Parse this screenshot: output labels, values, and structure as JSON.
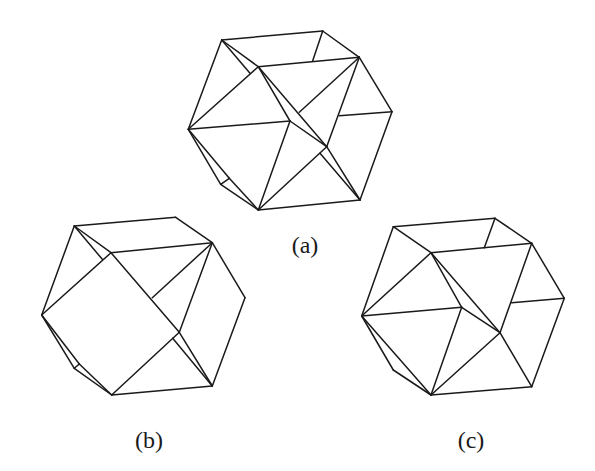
{
  "figure": {
    "panels": [
      {
        "id": "a",
        "label": "(a)",
        "label_pos": [
          305,
          253
        ],
        "edges": [
          [
            [
              221.7,
              40
            ],
            [
              322.7,
              31
            ]
          ],
          [
            [
              322.7,
              31
            ],
            [
              359.3,
              57.3
            ]
          ],
          [
            [
              322.7,
              31
            ],
            [
              312.7,
              60.7
            ]
          ],
          [
            [
              258.3,
              66.7
            ],
            [
              359.3,
              57.3
            ]
          ],
          [
            [
              221.7,
              40
            ],
            [
              258.3,
              66.7
            ]
          ],
          [
            [
              221.7,
              40
            ],
            [
              188.3,
              129.3
            ]
          ],
          [
            [
              221.7,
              40
            ],
            [
              250,
              73.3
            ]
          ],
          [
            [
              258.3,
              66.7
            ],
            [
              188.3,
              129.3
            ]
          ],
          [
            [
              359.3,
              57.3
            ],
            [
              392,
              111.7
            ]
          ],
          [
            [
              392,
              111.7
            ],
            [
              360,
              200
            ]
          ],
          [
            [
              392,
              111.7
            ],
            [
              339.3,
              115.7
            ]
          ],
          [
            [
              359.3,
              57.3
            ],
            [
              299.3,
              112.3
            ]
          ],
          [
            [
              359.3,
              57.3
            ],
            [
              326.7,
              146.7
            ]
          ],
          [
            [
              188.3,
              129.3
            ],
            [
              290,
              121
            ]
          ],
          [
            [
              258.3,
              66.7
            ],
            [
              290,
              121
            ]
          ],
          [
            [
              290,
              121
            ],
            [
              326.7,
              146.7
            ]
          ],
          [
            [
              258.3,
              66.7
            ],
            [
              326.7,
              146.7
            ]
          ],
          [
            [
              290,
              121
            ],
            [
              258.3,
              210
            ]
          ],
          [
            [
              326.7,
              146.7
            ],
            [
              258.3,
              210
            ]
          ],
          [
            [
              326.7,
              146.7
            ],
            [
              360,
              200
            ]
          ],
          [
            [
              320,
              153.3
            ],
            [
              360,
              200
            ]
          ],
          [
            [
              258.3,
              210
            ],
            [
              360,
              200
            ]
          ],
          [
            [
              188.3,
              129.3
            ],
            [
              220.7,
              184.3
            ]
          ],
          [
            [
              220.7,
              184.3
            ],
            [
              258.3,
              210
            ]
          ],
          [
            [
              188.3,
              129.3
            ],
            [
              229.3,
              178.3
            ]
          ],
          [
            [
              229.3,
              178.3
            ],
            [
              258.3,
              210
            ]
          ],
          [
            [
              220.7,
              184.3
            ],
            [
              229.3,
              178.3
            ]
          ]
        ]
      },
      {
        "id": "b",
        "label": "(b)",
        "label_pos": [
          149,
          448
        ],
        "edges": [
          [
            [
              74.3,
              226
            ],
            [
              175.7,
              217.3
            ]
          ],
          [
            [
              175.7,
              217.3
            ],
            [
              212.3,
              242.7
            ]
          ],
          [
            [
              111,
              252.7
            ],
            [
              212.3,
              242.7
            ]
          ],
          [
            [
              74.3,
              226
            ],
            [
              111,
              252.7
            ]
          ],
          [
            [
              74.3,
              226
            ],
            [
              41.7,
              315
            ]
          ],
          [
            [
              74.3,
              226
            ],
            [
              102.3,
              259.3
            ]
          ],
          [
            [
              111,
              252.7
            ],
            [
              41.7,
              315
            ]
          ],
          [
            [
              212.3,
              242.7
            ],
            [
              245,
              297.7
            ]
          ],
          [
            [
              245,
              297.7
            ],
            [
              212.3,
              386
            ]
          ],
          [
            [
              212.3,
              242.7
            ],
            [
              152.3,
              297.7
            ]
          ],
          [
            [
              212.3,
              242.7
            ],
            [
              179.3,
              332.3
            ]
          ],
          [
            [
              111,
              252.7
            ],
            [
              179.3,
              332.3
            ]
          ],
          [
            [
              179.3,
              332.3
            ],
            [
              111.7,
              395
            ]
          ],
          [
            [
              179.3,
              332.3
            ],
            [
              212.3,
              386
            ]
          ],
          [
            [
              172.7,
              338.3
            ],
            [
              212.3,
              386
            ]
          ],
          [
            [
              111.7,
              395
            ],
            [
              212.3,
              386
            ]
          ],
          [
            [
              41.7,
              315
            ],
            [
              74.3,
              368.3
            ]
          ],
          [
            [
              74.3,
              368.3
            ],
            [
              111.7,
              395
            ]
          ],
          [
            [
              41.7,
              315
            ],
            [
              79.3,
              364
            ]
          ],
          [
            [
              79.3,
              364
            ],
            [
              111.7,
              395
            ]
          ],
          [
            [
              74.3,
              368.3
            ],
            [
              79.3,
              364
            ]
          ]
        ]
      },
      {
        "id": "c",
        "label": "(c)",
        "label_pos": [
          471,
          448
        ],
        "edges": [
          [
            [
              393.3,
              226.7
            ],
            [
              495,
              218.3
            ]
          ],
          [
            [
              495,
              218.3
            ],
            [
              531.7,
              243.3
            ]
          ],
          [
            [
              495,
              218.3
            ],
            [
              484.3,
              247.7
            ]
          ],
          [
            [
              431,
              252.7
            ],
            [
              531.7,
              243.3
            ]
          ],
          [
            [
              393.3,
              226.7
            ],
            [
              431,
              252.7
            ]
          ],
          [
            [
              393.3,
              226.7
            ],
            [
              361.7,
              316
            ]
          ],
          [
            [
              431,
              252.7
            ],
            [
              361.7,
              316
            ]
          ],
          [
            [
              531.7,
              243.3
            ],
            [
              564.3,
              298.3
            ]
          ],
          [
            [
              564.3,
              298.3
            ],
            [
              531.7,
              386.7
            ]
          ],
          [
            [
              564.3,
              298.3
            ],
            [
              511.7,
              302.7
            ]
          ],
          [
            [
              531.7,
              243.3
            ],
            [
              500,
              332.7
            ]
          ],
          [
            [
              361.7,
              316
            ],
            [
              461.7,
              307.3
            ]
          ],
          [
            [
              431,
              252.7
            ],
            [
              461.7,
              307.3
            ]
          ],
          [
            [
              461.7,
              307.3
            ],
            [
              500,
              332.7
            ]
          ],
          [
            [
              431,
              252.7
            ],
            [
              500,
              332.7
            ]
          ],
          [
            [
              461.7,
              307.3
            ],
            [
              431,
              395
            ]
          ],
          [
            [
              500,
              332.7
            ],
            [
              431,
              395
            ]
          ],
          [
            [
              500,
              332.7
            ],
            [
              531.7,
              386.7
            ]
          ],
          [
            [
              431,
              395
            ],
            [
              531.7,
              386.7
            ]
          ],
          [
            [
              361.7,
              316
            ],
            [
              393.3,
              370
            ]
          ],
          [
            [
              393.3,
              370
            ],
            [
              431,
              395
            ]
          ],
          [
            [
              361.7,
              316
            ],
            [
              431,
              395
            ]
          ]
        ]
      }
    ]
  }
}
